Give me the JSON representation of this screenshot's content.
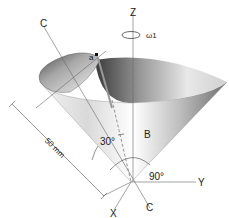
{
  "diagram": {
    "title_partial": "",
    "labels": {
      "axis_z": "Z",
      "axis_y": "Y",
      "axis_x": "X",
      "axis_c_top": "C",
      "axis_c_bottom": "C",
      "point_a": "a",
      "region_b": "B",
      "omega": "ω1",
      "angle_30": "30°",
      "angle_90": "90°",
      "dimension": "50 mm"
    }
  }
}
